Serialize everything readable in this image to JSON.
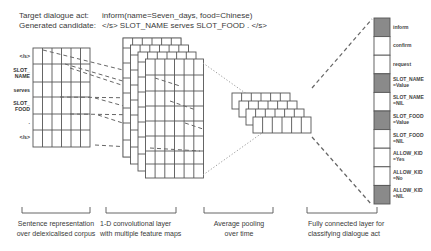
{
  "header": {
    "target_label": "Target dialogue act:",
    "target_value": "inform(name=Seven_days, food=Chinese)",
    "candidate_label": "Generated candidate:",
    "candidate_value": "</s> SLOT_NAME serves SLOT_FOOD . </s>"
  },
  "input_tokens": [
    {
      "line1": "</s>",
      "line2": ""
    },
    {
      "line1": "SLOT_",
      "line2": "NAME"
    },
    {
      "line1": "serves",
      "line2": ""
    },
    {
      "line1": "SLOT_",
      "line2": "FOOD"
    },
    {
      "line1": ".",
      "line2": ""
    },
    {
      "line1": "</s>",
      "line2": ""
    }
  ],
  "fc_outputs": [
    {
      "line1": "inform",
      "line2": "",
      "active": true
    },
    {
      "line1": "confirm",
      "line2": "",
      "active": false
    },
    {
      "line1": "request",
      "line2": "",
      "active": false
    },
    {
      "line1": "SLOT_NAME",
      "line2": "=Value",
      "active": true
    },
    {
      "line1": "SLOT_NAME",
      "line2": "=NIL",
      "active": false
    },
    {
      "line1": "SLOT_FOOD",
      "line2": "=Value",
      "active": true
    },
    {
      "line1": "SLOT_FOOD",
      "line2": "=NIL",
      "active": false
    },
    {
      "line1": "ALLOW_KID",
      "line2": "=Yes",
      "active": false
    },
    {
      "line1": "ALLOW_KID",
      "line2": "=No",
      "active": false
    },
    {
      "line1": "ALLOW_KID",
      "line2": "=NIL",
      "active": true
    }
  ],
  "captions": {
    "input": {
      "line1": "Sentence representation",
      "line2": "over delexicalised corpus"
    },
    "conv": {
      "line1": "1-D convolutional layer",
      "line2": "with multiple feature maps"
    },
    "pool": {
      "line1": "Average pooling",
      "line2": "over time"
    },
    "fc": {
      "line1": "Fully connected layer for",
      "line2": "classifying dialogue act"
    }
  },
  "colors": {
    "grid_line": "#555555",
    "active_cell": "#8a8a8a",
    "inactive_cell": "#ffffff",
    "dashed": "#666666",
    "dotted": "#9a9a9a"
  }
}
